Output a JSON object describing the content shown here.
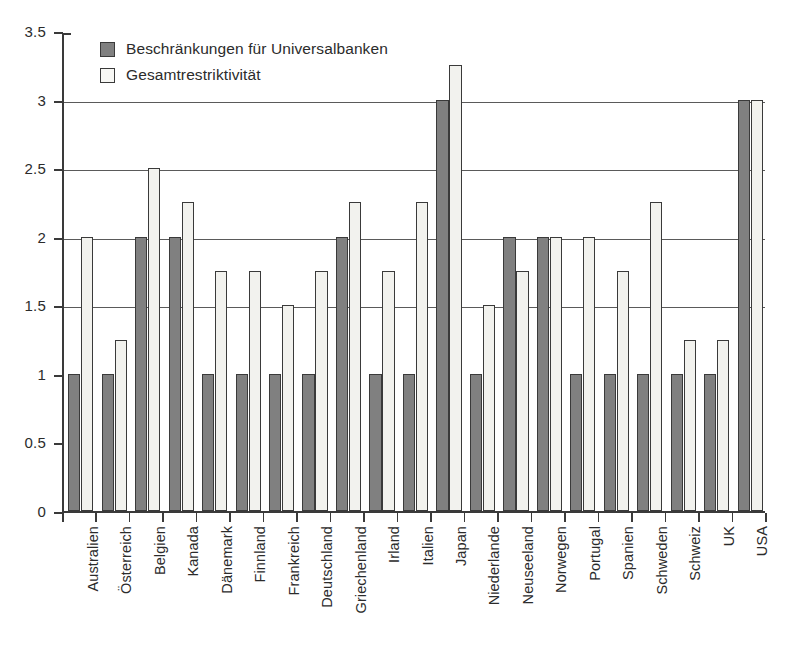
{
  "chart_data": {
    "type": "bar",
    "title": "",
    "xlabel": "",
    "ylabel": "",
    "ylim": [
      0,
      3.5
    ],
    "ytick_values": [
      0,
      0.5,
      1,
      1.5,
      2,
      2.5,
      3,
      3.5
    ],
    "ytick_labels": [
      "0",
      "0.5",
      "1",
      "1.5",
      "2",
      "2.5",
      "3",
      "3.5"
    ],
    "gridlines_at": [
      1.5,
      2,
      2.5,
      3
    ],
    "grid": true,
    "legend_position": "top-left",
    "categories": [
      "Australien",
      "Österreich",
      "Belgien",
      "Kanada",
      "Dänemark",
      "Finnland",
      "Frankreich",
      "Deutschland",
      "Griechenland",
      "Irland",
      "Italien",
      "Japan",
      "Niederlande",
      "Neuseeland",
      "Norwegen",
      "Portugal",
      "Spanien",
      "Schweden",
      "Schweiz",
      "UK",
      "USA"
    ],
    "series": [
      {
        "name": "Beschränkungen für Universalbanken",
        "color": "#808080",
        "values": [
          1,
          1,
          2,
          2,
          1,
          1,
          1,
          1,
          2,
          1,
          1,
          3,
          1,
          2,
          2,
          1,
          1,
          1,
          1,
          1,
          3
        ]
      },
      {
        "name": "Gesamtrestriktivität",
        "color": "#f2f2ee",
        "values": [
          2,
          1.25,
          2.5,
          2.25,
          1.75,
          1.75,
          1.5,
          1.75,
          2.25,
          1.75,
          2.25,
          3.25,
          1.5,
          1.75,
          2,
          2,
          1.75,
          2.25,
          1.25,
          1.25,
          3
        ]
      }
    ]
  },
  "legend": {
    "items": [
      {
        "label": "Beschränkungen für Universalbanken",
        "swatch": "dark"
      },
      {
        "label": "Gesamtrestriktivität",
        "swatch": "light"
      }
    ]
  }
}
